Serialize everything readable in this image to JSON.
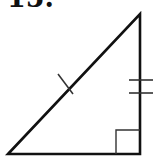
{
  "problem": {
    "label": "15."
  },
  "figure": {
    "type": "right-triangle",
    "stroke_color": "#111111",
    "vertices": {
      "left": [
        8,
        154
      ],
      "top": [
        140,
        14
      ],
      "right_angle": [
        140,
        154
      ]
    },
    "markings": {
      "hypotenuse_ticks": 1,
      "vertical_leg_ticks": 2,
      "right_angle_marker": true
    }
  }
}
